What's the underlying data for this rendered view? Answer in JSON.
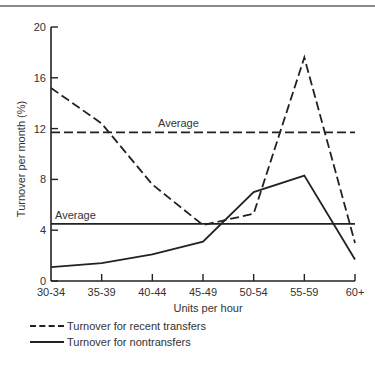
{
  "chart_data": {
    "type": "line",
    "title": "",
    "xlabel": "Units per hour",
    "ylabel": "Turnover per month (%)",
    "categories": [
      "30-34",
      "35-39",
      "40-44",
      "45-49",
      "50-54",
      "55-59",
      "60+"
    ],
    "yticks": [
      0,
      4,
      8,
      12,
      16,
      20
    ],
    "ylim": [
      0,
      20
    ],
    "grid": false,
    "legend_position": "bottom-left",
    "series": [
      {
        "name": "Turnover for recent transfers",
        "style": "dashed",
        "values": [
          15.2,
          12.4,
          7.6,
          4.4,
          5.3,
          17.6,
          3.0
        ]
      },
      {
        "name": "Turnover for nontransfers",
        "style": "solid",
        "values": [
          1.1,
          1.4,
          2.1,
          3.1,
          7.0,
          8.3,
          1.7
        ]
      }
    ],
    "reference_lines": [
      {
        "label": "Average",
        "value": 11.7,
        "style": "dashed",
        "series": "Turnover for recent transfers"
      },
      {
        "label": "Average",
        "value": 4.5,
        "style": "solid",
        "series": "Turnover for nontransfers"
      }
    ]
  },
  "legend": {
    "dashed_label": "Turnover for recent transfers",
    "solid_label": "Turnover for nontransfers"
  },
  "labels": {
    "average_upper": "Average",
    "average_lower": "Average",
    "xlabel": "Units per hour",
    "ylabel": "Turnover per month (%)"
  }
}
